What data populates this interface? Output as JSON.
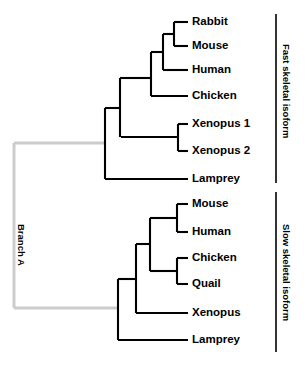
{
  "figure": {
    "type": "phylogenetic-tree",
    "background_color": "#ffffff",
    "line_color": "#000000",
    "highlight_branch_color": "#cccccc"
  },
  "branch_label": {
    "text": "Branch A",
    "color": "#000000"
  },
  "groups": [
    {
      "id": "fast",
      "label": "Fast skeletal isoform",
      "bracket": {
        "x": 276,
        "y_top": 14,
        "y_bottom": 183
      }
    },
    {
      "id": "slow",
      "label": "Slow skeletal isoform",
      "bracket": {
        "x": 276,
        "y_top": 192,
        "y_bottom": 352
      }
    }
  ],
  "tips": [
    {
      "label": "Rabbit",
      "group": "fast",
      "x": 192,
      "y": 22
    },
    {
      "label": "Mouse",
      "group": "fast",
      "x": 192,
      "y": 46
    },
    {
      "label": "Human",
      "group": "fast",
      "x": 192,
      "y": 70
    },
    {
      "label": "Chicken",
      "group": "fast",
      "x": 192,
      "y": 96
    },
    {
      "label": "Xenopus 1",
      "group": "fast",
      "x": 192,
      "y": 124
    },
    {
      "label": "Xenopus 2",
      "group": "fast",
      "x": 192,
      "y": 151
    },
    {
      "label": "Lamprey",
      "group": "fast",
      "x": 192,
      "y": 179
    },
    {
      "label": "Mouse",
      "group": "slow",
      "x": 192,
      "y": 204
    },
    {
      "label": "Human",
      "group": "slow",
      "x": 192,
      "y": 232
    },
    {
      "label": "Chicken",
      "group": "slow",
      "x": 192,
      "y": 258
    },
    {
      "label": "Quail",
      "group": "slow",
      "x": 192,
      "y": 284
    },
    {
      "label": "Xenopus",
      "group": "slow",
      "x": 192,
      "y": 313
    },
    {
      "label": "Lamprey",
      "group": "slow",
      "x": 192,
      "y": 340
    }
  ],
  "chart_data": {
    "type": "tree",
    "title": "",
    "newick": "((((((Rabbit,Mouse),Human),Chicken),(Xenopus_1,Xenopus_2)),Lamprey)Fast,(((Mouse,Human),(Chicken,Quail)),Xenopus,Lamprey)Slow)BranchA;",
    "tip_x": 188,
    "black_segments": [
      {
        "name": "rabbit-tip",
        "x1": 174,
        "y1": 22,
        "x2": 188,
        "y2": 22
      },
      {
        "name": "mouse-fast-tip",
        "x1": 174,
        "y1": 46,
        "x2": 188,
        "y2": 46
      },
      {
        "name": "rabbit-mouse-node",
        "x1": 174,
        "y1": 22,
        "x2": 174,
        "y2": 46
      },
      {
        "name": "rabbit-mouse-stem",
        "x1": 163,
        "y1": 34,
        "x2": 174,
        "y2": 34
      },
      {
        "name": "human-tip",
        "x1": 163,
        "y1": 70,
        "x2": 188,
        "y2": 70
      },
      {
        "name": "human-node",
        "x1": 163,
        "y1": 34,
        "x2": 163,
        "y2": 70
      },
      {
        "name": "human-stem",
        "x1": 151,
        "y1": 52,
        "x2": 163,
        "y2": 52
      },
      {
        "name": "chicken-fast-tip",
        "x1": 151,
        "y1": 96,
        "x2": 188,
        "y2": 96
      },
      {
        "name": "chicken-node",
        "x1": 151,
        "y1": 52,
        "x2": 151,
        "y2": 96
      },
      {
        "name": "chicken-stem",
        "x1": 120,
        "y1": 78,
        "x2": 151,
        "y2": 78
      },
      {
        "name": "xenopus1-tip",
        "x1": 178,
        "y1": 124,
        "x2": 188,
        "y2": 124
      },
      {
        "name": "xenopus2-tip",
        "x1": 178,
        "y1": 151,
        "x2": 188,
        "y2": 151
      },
      {
        "name": "xenopus-node",
        "x1": 178,
        "y1": 124,
        "x2": 178,
        "y2": 151
      },
      {
        "name": "xenopus-stem",
        "x1": 121,
        "y1": 137,
        "x2": 178,
        "y2": 137
      },
      {
        "name": "fast-crown-node",
        "x1": 120,
        "y1": 78,
        "x2": 120,
        "y2": 137
      },
      {
        "name": "fast-crown-stem",
        "x1": 105,
        "y1": 108,
        "x2": 120,
        "y2": 108
      },
      {
        "name": "lamprey-fast-tip",
        "x1": 105,
        "y1": 179,
        "x2": 188,
        "y2": 179
      },
      {
        "name": "fast-root-node",
        "x1": 105,
        "y1": 108,
        "x2": 105,
        "y2": 179
      },
      {
        "name": "mouse-slow-tip",
        "x1": 177,
        "y1": 204,
        "x2": 188,
        "y2": 204
      },
      {
        "name": "human-slow-tip",
        "x1": 177,
        "y1": 232,
        "x2": 188,
        "y2": 232
      },
      {
        "name": "mammal-slow-node",
        "x1": 177,
        "y1": 204,
        "x2": 177,
        "y2": 232
      },
      {
        "name": "mammal-slow-stem",
        "x1": 150,
        "y1": 218,
        "x2": 177,
        "y2": 218
      },
      {
        "name": "chicken-slow-tip",
        "x1": 177,
        "y1": 258,
        "x2": 188,
        "y2": 258
      },
      {
        "name": "quail-slow-tip",
        "x1": 177,
        "y1": 284,
        "x2": 188,
        "y2": 284
      },
      {
        "name": "bird-slow-node",
        "x1": 177,
        "y1": 258,
        "x2": 177,
        "y2": 284
      },
      {
        "name": "bird-slow-stem",
        "x1": 150,
        "y1": 271,
        "x2": 177,
        "y2": 271
      },
      {
        "name": "amniote-slow-node",
        "x1": 150,
        "y1": 218,
        "x2": 150,
        "y2": 271
      },
      {
        "name": "amniote-slow-stem",
        "x1": 136,
        "y1": 244,
        "x2": 150,
        "y2": 244
      },
      {
        "name": "xenopus-slow-tip",
        "x1": 136,
        "y1": 313,
        "x2": 188,
        "y2": 313
      },
      {
        "name": "tetrapod-slow-node",
        "x1": 136,
        "y1": 244,
        "x2": 136,
        "y2": 313
      },
      {
        "name": "tetrapod-slow-stem",
        "x1": 118,
        "y1": 279,
        "x2": 136,
        "y2": 279
      },
      {
        "name": "lamprey-slow-tip",
        "x1": 118,
        "y1": 340,
        "x2": 188,
        "y2": 340
      },
      {
        "name": "slow-root-node",
        "x1": 118,
        "y1": 279,
        "x2": 118,
        "y2": 340
      }
    ],
    "gray_segments": [
      {
        "name": "branch-a-top",
        "x1": 14,
        "y1": 143,
        "x2": 105,
        "y2": 143
      },
      {
        "name": "branch-a-stem",
        "x1": 14,
        "y1": 143,
        "x2": 14,
        "y2": 308
      },
      {
        "name": "branch-a-bottom",
        "x1": 14,
        "y1": 308,
        "x2": 118,
        "y2": 308
      }
    ]
  }
}
